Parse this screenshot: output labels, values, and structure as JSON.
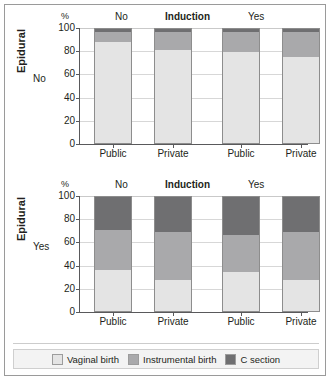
{
  "figure": {
    "axis_label": "Epidural",
    "header": {
      "percent": "%",
      "left_group": "No",
      "center_title": "Induction",
      "right_group": "Yes"
    },
    "y_ticks": [
      "100",
      "80",
      "60",
      "40",
      "20",
      "0"
    ],
    "x_categories": [
      "Public",
      "Private",
      "Public",
      "Private"
    ],
    "panels": [
      {
        "row_label": "No"
      },
      {
        "row_label": "Yes"
      }
    ],
    "legend": [
      {
        "label": "Vaginal birth",
        "color": "#e4e4e4"
      },
      {
        "label": "Instrumental birth",
        "color": "#a9a9ab"
      },
      {
        "label": "C section",
        "color": "#6f6f71"
      }
    ]
  },
  "chart_data": [
    {
      "type": "bar",
      "title": "Induction",
      "subtitle": "Epidural: No",
      "stacked": true,
      "stack_normalized_percent": true,
      "categories": [
        "Public",
        "Private",
        "Public",
        "Private"
      ],
      "group_labels": [
        "No",
        "No",
        "Yes",
        "Yes"
      ],
      "group_name": "Induction",
      "series": [
        {
          "name": "Vaginal birth",
          "color": "#e4e4e4",
          "values": [
            89,
            82,
            80,
            75
          ]
        },
        {
          "name": "Instrumental birth",
          "color": "#a9a9ab",
          "values": [
            8,
            15,
            17,
            22
          ]
        },
        {
          "name": "C section",
          "color": "#6f6f71",
          "values": [
            3,
            3,
            3,
            3
          ]
        }
      ],
      "xlabel": "",
      "ylabel": "%",
      "ylim": [
        0,
        100
      ],
      "yticks": [
        0,
        20,
        40,
        60,
        80,
        100
      ],
      "grid": true,
      "legend_position": "bottom"
    },
    {
      "type": "bar",
      "title": "Induction",
      "subtitle": "Epidural: Yes",
      "stacked": true,
      "stack_normalized_percent": true,
      "categories": [
        "Public",
        "Private",
        "Public",
        "Private"
      ],
      "group_labels": [
        "No",
        "No",
        "Yes",
        "Yes"
      ],
      "group_name": "Induction",
      "series": [
        {
          "name": "Vaginal birth",
          "color": "#e4e4e4",
          "values": [
            36,
            27,
            34,
            27
          ]
        },
        {
          "name": "Instrumental birth",
          "color": "#a9a9ab",
          "values": [
            35,
            42,
            33,
            42
          ]
        },
        {
          "name": "C section",
          "color": "#6f6f71",
          "values": [
            29,
            31,
            33,
            31
          ]
        }
      ],
      "xlabel": "",
      "ylabel": "%",
      "ylim": [
        0,
        100
      ],
      "yticks": [
        0,
        20,
        40,
        60,
        80,
        100
      ],
      "grid": true,
      "legend_position": "bottom"
    }
  ]
}
